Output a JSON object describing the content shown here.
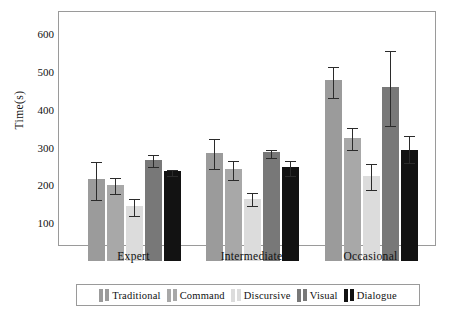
{
  "chart_data": {
    "type": "bar",
    "title": "",
    "xlabel": "",
    "ylabel": "Time(s)",
    "categories": [
      "Expert",
      "Intermediate",
      "Occasional"
    ],
    "ylim": [
      0,
      650
    ],
    "yticks": [
      100,
      200,
      300,
      400,
      500,
      600
    ],
    "grid": false,
    "legend_position": "bottom",
    "error_bars": "yes",
    "series": [
      {
        "name": "Traditional",
        "color": "#9b9b9b",
        "values": [
          218,
          287,
          478
        ],
        "err_low": [
          165,
          247,
          435
        ],
        "err_high": [
          268,
          327,
          518
        ]
      },
      {
        "name": "Command",
        "color": "#a8a8a8",
        "values": [
          202,
          243,
          325
        ],
        "err_low": [
          181,
          217,
          296
        ],
        "err_high": [
          224,
          271,
          356
        ]
      },
      {
        "name": "Discursive",
        "color": "#dcdcdc",
        "values": [
          145,
          165,
          225
        ],
        "err_low": [
          121,
          148,
          191
        ],
        "err_high": [
          170,
          185,
          262
        ]
      },
      {
        "name": "Visual",
        "color": "#787878",
        "values": [
          268,
          288,
          460
        ],
        "err_low": [
          251,
          275,
          360
        ],
        "err_high": [
          285,
          300,
          560
        ]
      },
      {
        "name": "Dialogue",
        "color": "#121212",
        "values": [
          237,
          249,
          293
        ],
        "err_low": [
          228,
          228,
          262
        ],
        "err_high": [
          246,
          271,
          337
        ]
      }
    ]
  },
  "axis": {
    "y_label": "Time(s)",
    "y_tick_labels": [
      "600",
      "500",
      "400",
      "300",
      "200",
      "100"
    ],
    "x_tick_labels": [
      "Expert",
      "Intermediate",
      "Occasional"
    ]
  },
  "legend": {
    "entries": [
      {
        "label": "Traditional"
      },
      {
        "label": "Command"
      },
      {
        "label": "Discursive"
      },
      {
        "label": "Visual"
      },
      {
        "label": "Dialogue"
      }
    ]
  },
  "colors": {
    "frame": "#9a9a9a",
    "error_bar": "#2b2b2b",
    "background": "#ffffff",
    "text": "#111111"
  }
}
